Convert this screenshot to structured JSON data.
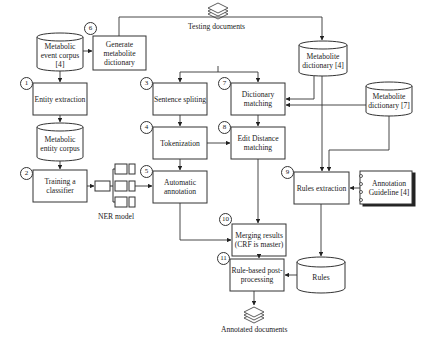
{
  "diagram": {
    "nodes": {
      "metabolic_event_corpus": {
        "label": "Metabolic event corpus [4]",
        "shape": "cylinder"
      },
      "generate_dictionary": {
        "label": "Generate metabolite dictionary",
        "shape": "box",
        "step": "6"
      },
      "entity_extraction": {
        "label": "Entity extraction",
        "shape": "box",
        "step": "1"
      },
      "metabolic_entity_corpus": {
        "label": "Metabolic entity corpus",
        "shape": "cylinder"
      },
      "training_classifier": {
        "label": "Training a classifier",
        "shape": "box",
        "step": "2"
      },
      "ner_model": {
        "label": "NER model",
        "shape": "network-icon"
      },
      "testing_documents": {
        "label": "Testing documents",
        "shape": "documents-icon"
      },
      "sentence_splitting": {
        "label": "Sentence spliting",
        "shape": "box",
        "step": "3"
      },
      "tokenization": {
        "label": "Tokenization",
        "shape": "box",
        "step": "4"
      },
      "automatic_annotation": {
        "label": "Automatic annotation",
        "shape": "box",
        "step": "5"
      },
      "dictionary_matching": {
        "label": "Dictionary matching",
        "shape": "box",
        "step": "7"
      },
      "edit_distance_matching": {
        "label": "Edit Distance matching",
        "shape": "box",
        "step": "8"
      },
      "metabolite_dictionary_4": {
        "label": "Metabolite dictionary [4]",
        "shape": "cylinder"
      },
      "metabolite_dictionary_7": {
        "label": "Metabolite dictionary [7]",
        "shape": "cylinder"
      },
      "rules_extraction": {
        "label": "Rules extraction",
        "shape": "box",
        "step": "9"
      },
      "annotation_guideline": {
        "label": "Annotation Guideline [4]",
        "shape": "notebook"
      },
      "merging_results": {
        "label": "Merging results (CRF is master)",
        "shape": "box",
        "step": "10"
      },
      "rules": {
        "label": "Rules",
        "shape": "cylinder"
      },
      "rule_based_postprocessing": {
        "label": "Rule-based post-processing",
        "shape": "box",
        "step": "11"
      },
      "annotated_documents": {
        "label": "Annotated documents",
        "shape": "documents-icon"
      }
    },
    "steps": [
      "1",
      "2",
      "3",
      "4",
      "5",
      "6",
      "7",
      "8",
      "9",
      "10",
      "11"
    ],
    "edges": [
      [
        "metabolic_event_corpus",
        "generate_dictionary"
      ],
      [
        "generate_dictionary",
        "metabolite_dictionary_4"
      ],
      [
        "metabolic_event_corpus",
        "entity_extraction"
      ],
      [
        "entity_extraction",
        "metabolic_entity_corpus"
      ],
      [
        "metabolic_entity_corpus",
        "training_classifier"
      ],
      [
        "training_classifier",
        "ner_model"
      ],
      [
        "ner_model",
        "automatic_annotation"
      ],
      [
        "testing_documents",
        "sentence_splitting"
      ],
      [
        "testing_documents",
        "dictionary_matching"
      ],
      [
        "sentence_splitting",
        "tokenization"
      ],
      [
        "tokenization",
        "automatic_annotation"
      ],
      [
        "tokenization",
        "edit_distance_matching"
      ],
      [
        "dictionary_matching",
        "edit_distance_matching"
      ],
      [
        "metabolite_dictionary_4",
        "dictionary_matching"
      ],
      [
        "metabolite_dictionary_7",
        "dictionary_matching"
      ],
      [
        "metabolite_dictionary_4",
        "rules_extraction"
      ],
      [
        "metabolite_dictionary_7",
        "rules_extraction"
      ],
      [
        "annotation_guideline",
        "rules_extraction"
      ],
      [
        "rules_extraction",
        "rules"
      ],
      [
        "automatic_annotation",
        "merging_results"
      ],
      [
        "edit_distance_matching",
        "merging_results"
      ],
      [
        "merging_results",
        "rule_based_postprocessing"
      ],
      [
        "rules",
        "rule_based_postprocessing"
      ],
      [
        "rule_based_postprocessing",
        "annotated_documents"
      ]
    ]
  }
}
